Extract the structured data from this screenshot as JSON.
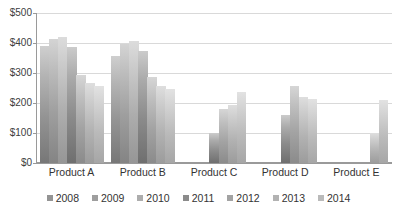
{
  "chart_data": {
    "type": "bar",
    "title": "",
    "xlabel": "",
    "ylabel": "",
    "ylim": [
      0,
      500
    ],
    "ytick_values": [
      0,
      100,
      200,
      300,
      400,
      500
    ],
    "ytick_labels": [
      "$0",
      "$100",
      "$200",
      "$300",
      "$400",
      "$500"
    ],
    "grid": true,
    "legend_position": "bottom",
    "categories": [
      "Product A",
      "Product B",
      "Product C",
      "Product D",
      "Product E"
    ],
    "series": [
      {
        "name": "2008",
        "color": "#949494",
        "values": [
          390,
          357,
          null,
          null,
          null
        ]
      },
      {
        "name": "2009",
        "color": "#9e9e9e",
        "values": [
          415,
          397,
          null,
          null,
          null
        ]
      },
      {
        "name": "2010",
        "color": "#adadad",
        "values": [
          420,
          407,
          null,
          null,
          null
        ]
      },
      {
        "name": "2011",
        "color": "#8b8b8b",
        "values": [
          388,
          373,
          100,
          160,
          null
        ]
      },
      {
        "name": "2012",
        "color": "#a3a3a3",
        "values": [
          295,
          287,
          180,
          257,
          null
        ]
      },
      {
        "name": "2013",
        "color": "#b2b2b2",
        "values": [
          267,
          258,
          195,
          220,
          100
        ]
      },
      {
        "name": "2014",
        "color": "#bababa",
        "values": [
          257,
          247,
          238,
          212,
          210
        ]
      }
    ],
    "legend_entries": [
      "2008",
      "2009",
      "2010",
      "2011",
      "2012",
      "2013",
      "2014"
    ]
  },
  "accessibility": {
    "chart_description": "Grouped bar chart of yearly values by product"
  }
}
